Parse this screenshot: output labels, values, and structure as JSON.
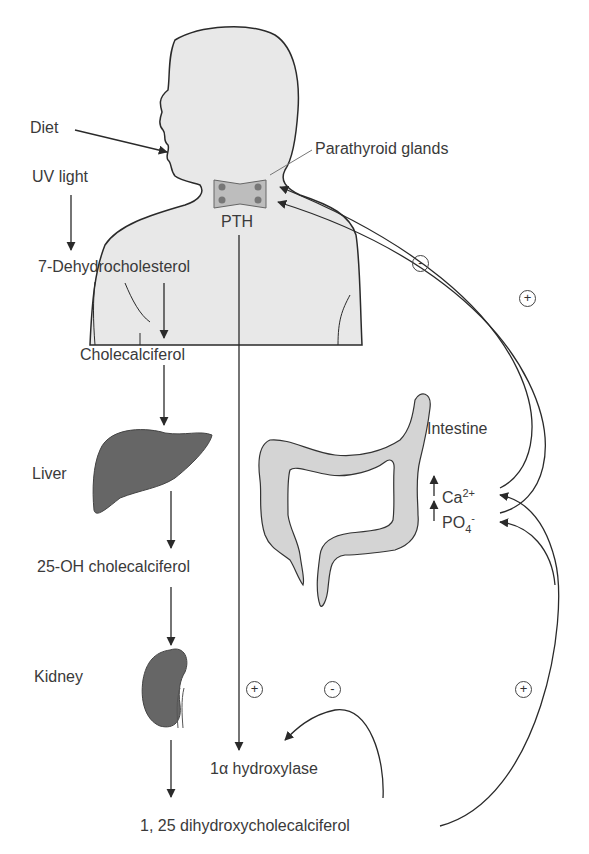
{
  "labels": {
    "diet": "Diet",
    "uv_light": "UV light",
    "dehydrocholesterol": "7-Dehydrocholesterol",
    "cholecalciferol": "Cholecalciferol",
    "parathyroid": "Parathyroid glands",
    "pth": "PTH",
    "liver": "Liver",
    "oh_chole": "25-OH cholecalciferol",
    "kidney": "Kidney",
    "intestine": "Intestine",
    "ca_base": "Ca",
    "ca_sup": "2+",
    "po_base": "PO",
    "po_sub": "4",
    "po_sup": "-",
    "hydroxylase": "1α hydroxylase",
    "dihydroxy": "1, 25 dihydroxycholecalciferol"
  },
  "signs": {
    "neck_minus": "-",
    "neck_plus": "+",
    "pth_plus": "+",
    "feedback_minus": "-",
    "intestine_plus": "+"
  },
  "colors": {
    "body_fill": "#e8e8e8",
    "organ_dark": "#666666",
    "intestine_fill": "#d4d4d4",
    "line": "#2a2a2a"
  }
}
